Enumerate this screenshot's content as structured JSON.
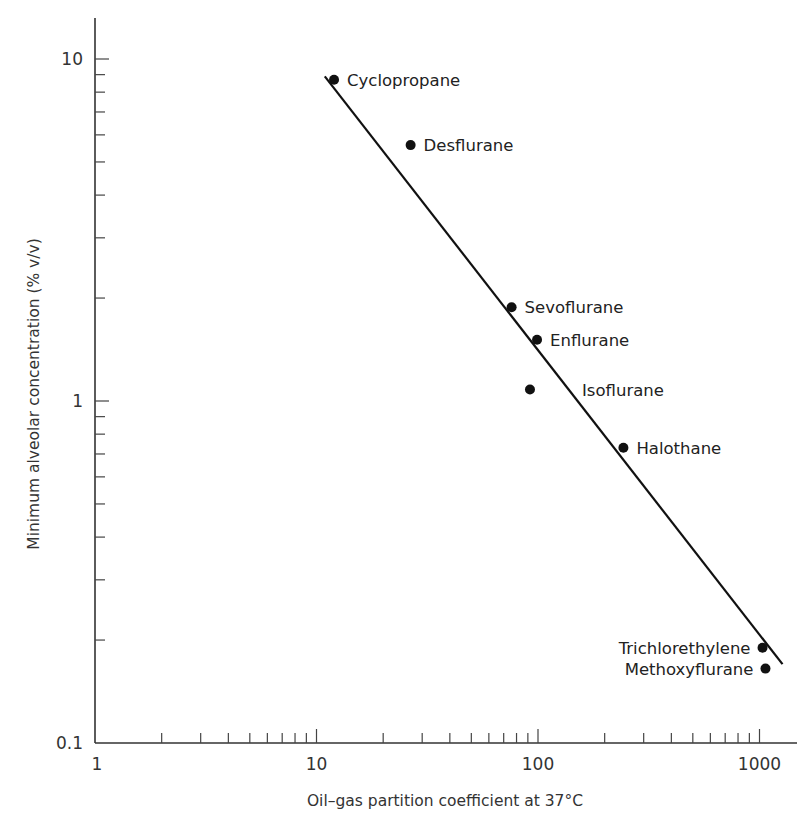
{
  "chart_data": {
    "type": "scatter",
    "title": "",
    "xlabel": "Oil–gas partition coefficient at 37°C",
    "ylabel": "Minimum alveolar concentration (% v/v)",
    "xscale": "log",
    "yscale": "log",
    "xlim": [
      1,
      1500
    ],
    "ylim": [
      0.1,
      13
    ],
    "x_ticks": [
      1,
      10,
      100,
      1000
    ],
    "x_tick_labels": [
      "1",
      "10",
      "100",
      "1000"
    ],
    "y_ticks": [
      0.1,
      1,
      10
    ],
    "y_tick_labels": [
      "0.1",
      "1",
      "10"
    ],
    "grid": false,
    "legend": null,
    "points": [
      {
        "name": "Cyclopropane",
        "x": 12,
        "y": 8.7,
        "label_side": "right"
      },
      {
        "name": "Desflurane",
        "x": 26.6,
        "y": 5.6,
        "label_side": "right"
      },
      {
        "name": "Sevoflurane",
        "x": 76,
        "y": 1.88,
        "label_side": "right"
      },
      {
        "name": "Enflurane",
        "x": 99,
        "y": 1.51,
        "label_side": "right"
      },
      {
        "name": "Isoflurane",
        "x": 92,
        "y": 1.08,
        "label_side": "right-offset"
      },
      {
        "name": "Halothane",
        "x": 243,
        "y": 0.73,
        "label_side": "right"
      },
      {
        "name": "Trichlorethylene",
        "x": 1032,
        "y": 0.19,
        "label_side": "left"
      },
      {
        "name": "Methoxyflurane",
        "x": 1064,
        "y": 0.165,
        "label_side": "left"
      }
    ],
    "fit_line": {
      "x": [
        10.9,
        1270
      ],
      "y": [
        8.9,
        0.17
      ]
    },
    "colors": {
      "points": "#111111",
      "line": "#111111",
      "axes": "#333333"
    }
  }
}
